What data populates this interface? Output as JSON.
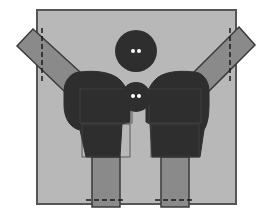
{
  "diagram": {
    "colors": {
      "background": "#ffffff",
      "box_fill": "#b8b8b8",
      "box_stroke": "#555555",
      "body_fill": "#2e2e2e",
      "body_outline": "#444444",
      "limb_fill": "#8a8a8a",
      "limb_stroke": "#3a3a3a",
      "eye_fill": "#ffffff",
      "dash_color": "#1a1a1a"
    },
    "box": {
      "x": 37,
      "y": 10,
      "width": 199,
      "height": 194
    },
    "large_head": {
      "cx": 136,
      "cy": 51,
      "r": 21
    },
    "small_head": {
      "cx": 136,
      "cy": 97,
      "r": 15
    },
    "left_figure": {
      "arm": "33,29 17,46 64,91 80,72",
      "arm_dash": {
        "x": 42,
        "y1": 28,
        "y2": 83
      },
      "torso": "M64,91 C64,80 72,72 80,72 C95,70 112,72 120,80 C127,87 130,95 130,110 L130,122 L122,124 L120,157 L86,157 L80,130 C70,128 64,118 64,105 Z",
      "leg": {
        "x": 92,
        "y": 157,
        "width": 28,
        "height": 50
      },
      "leg_dash": {
        "y": 200,
        "x1": 86,
        "x2": 126
      }
    },
    "right_figure": {
      "arm": "239,27 255,45 209,91 194,72",
      "arm_dash": {
        "x": 230,
        "y1": 28,
        "y2": 82
      },
      "torso": "M209,91 C209,80 202,72 194,72 C178,70 162,72 155,80 C148,87 146,95 146,110 L146,122 L150,124 L152,157 L200,157 L204,130 C210,120 209,105 209,91 Z",
      "leg": {
        "x": 161,
        "y": 157,
        "width": 28,
        "height": 50
      },
      "leg_dash": {
        "y": 200,
        "x1": 155,
        "x2": 195
      }
    }
  }
}
